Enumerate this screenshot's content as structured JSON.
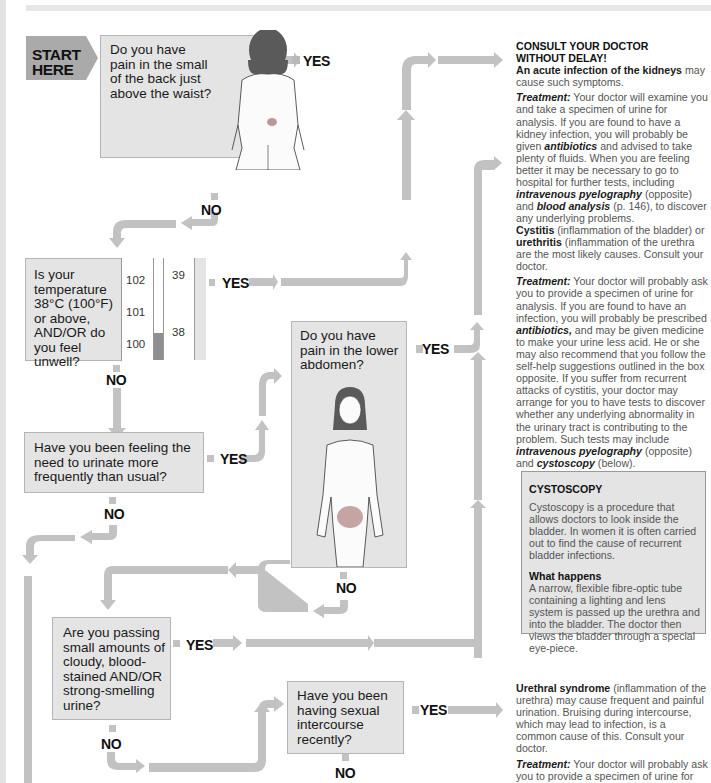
{
  "page": {
    "colors": {
      "arrow": "#c0c0c0",
      "box": "#e4e4e4",
      "text": "#1a1a1a",
      "body_text": "#555555"
    }
  },
  "start": {
    "label_line1": "START",
    "label_line2": "HERE"
  },
  "labels": {
    "yes": "YES",
    "no": "NO"
  },
  "questions": [
    {
      "id": "q1",
      "text": "Do you have pain in the small of the back just above the waist?"
    },
    {
      "id": "q2",
      "text": "Is your temperature 38°C (100°F) or above, AND/OR do you feel unwell?"
    },
    {
      "id": "q3",
      "text": "Do you have pain in the lower abdomen?"
    },
    {
      "id": "q4",
      "text": "Have you been feeling the need to urinate more frequently than usual?"
    },
    {
      "id": "q5",
      "text": "Are you passing small amounts of cloudy, blood-stained AND/OR strong-smelling urine?"
    },
    {
      "id": "q6",
      "text": "Have you been having sexual intercourse recently?"
    }
  ],
  "thermometer": {
    "fahrenheit_ticks": [
      "102",
      "101",
      "100"
    ],
    "celsius_ticks": [
      "39",
      "38"
    ]
  },
  "outcomes": {
    "kidney": {
      "heading_line1": "CONSULT YOUR DOCTOR",
      "heading_line2": "WITHOUT DELAY!",
      "cause_bold": "An acute infection of the kidneys",
      "cause_rest": " may cause such symptoms.",
      "treatment_label": "Treatment:",
      "treatment_a": " Your doctor will examine you and take a specimen of urine for analysis. If you are found to have a kidney infection, you will probably be given ",
      "treatment_b": "antibiotics",
      "treatment_c": " and advised to take plenty of fluids. When you are feeling better it may be necessary to go to hospital for further tests, including ",
      "treatment_d": "intravenous pyelography",
      "treatment_e": " (opposite) and ",
      "treatment_f": "blood analysis",
      "treatment_g": " (p. 146), to discover any underlying problems."
    },
    "cystitis": {
      "bold1": "Cystitis",
      "text1": " (inflammation of the bladder) or ",
      "bold2": "urethritis",
      "text2": " (inflammation of the urethra are the most likely causes. Consult your doctor.",
      "treatment_label": "Treatment:",
      "treatment_a": " Your doctor will probably ask you to provide a specimen of urine for analysis. If you are found to have an infection, you will probably be prescribed ",
      "treatment_b": "antibiotics,",
      "treatment_c": " and may be given medicine to make your urine less acid. He or she may also recommend that you follow the self-help suggestions outlined in the box opposite. If you suffer from recurrent attacks of cystitis, your doctor may arrange for you to have tests to discover whether any underlying abnormality in the urinary tract is contributing to the problem. Such tests may include ",
      "treatment_d": "intravenous pyelography",
      "treatment_e": " (opposite) and ",
      "treatment_f": "cystoscopy",
      "treatment_g": " (below)."
    },
    "urethral": {
      "bold": "Urethral syndrome",
      "text": " (inflammation of the urethra) may cause frequent and painful urination. Bruising during intercourse, which may lead to infection, is a common cause of this. Consult your doctor.",
      "treatment_label": "Treatment:",
      "treatment_a": " Your doctor will probably ask you to provide a specimen of urine for analysis to find out if you have an infection. If an infection is found, you will"
    }
  },
  "cystoscopy_box": {
    "title": "CYSTOSCOPY",
    "intro": "Cystoscopy is a procedure that allows doctors to look inside the bladder. In women it is often carried out to find the cause of recurrent bladder infections.",
    "subhead": "What happens",
    "body": "A narrow, flexible fibre-optic tube containing a lighting and lens system is passed up the urethra and into the bladder. The doctor then views the bladder through a special eye-piece."
  }
}
